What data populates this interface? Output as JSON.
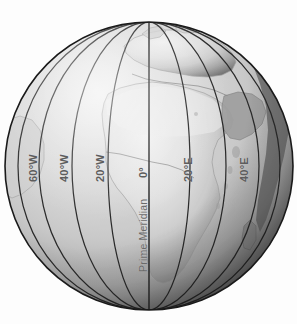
{
  "figure": {
    "name": "globe-meridians",
    "alt_title": "Shaded relief globe centered on Africa with labeled meridians",
    "background_color": "#fdfdfd"
  },
  "globe": {
    "center_x": 149,
    "center_y": 166,
    "radius": 144,
    "outline_color": "#1a1a1a",
    "ocean_light": "#d8d8d8",
    "ocean_mid": "#bdbdbd",
    "ocean_dark": "#4a4a4a",
    "land_light": "#e7e7e7",
    "land_mid": "#c9c9c9",
    "land_dark": "#7c7c7c",
    "graticule_color": "#2b2b2b"
  },
  "meridians": [
    {
      "id": "60W",
      "label": "60°W",
      "longitude": -60,
      "x": 27,
      "y": 182,
      "rotated": true
    },
    {
      "id": "40W",
      "label": "40°W",
      "longitude": -40,
      "x": 58,
      "y": 182,
      "rotated": true
    },
    {
      "id": "20W",
      "label": "20°W",
      "longitude": -20,
      "x": 94,
      "y": 182,
      "rotated": true
    },
    {
      "id": "0",
      "label": "0°",
      "longitude": 0,
      "x": 137,
      "y": 178,
      "rotated": true
    },
    {
      "id": "20E",
      "label": "20°E",
      "longitude": 20,
      "x": 182,
      "y": 182,
      "rotated": true
    },
    {
      "id": "40E",
      "label": "40°E",
      "longitude": 40,
      "x": 238,
      "y": 182,
      "rotated": true
    }
  ],
  "annotations": {
    "prime_meridian_label": "Prime Meridian",
    "prime_meridian_x": 137,
    "prime_meridian_y": 272
  }
}
